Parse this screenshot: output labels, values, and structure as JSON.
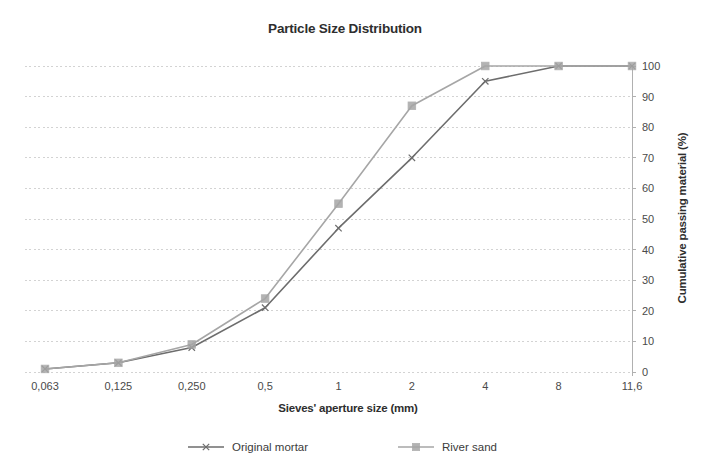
{
  "chart_data": {
    "type": "line",
    "title": "Particle Size Distribution",
    "xlabel": "Sieves' aperture size (mm)",
    "ylabel": "Cumulative passing material (%)",
    "categories": [
      "0,063",
      "0,125",
      "0,250",
      "0,5",
      "1",
      "2",
      "4",
      "8",
      "11,6"
    ],
    "ylim": [
      0,
      100
    ],
    "yticks": [
      "0",
      "10",
      "20",
      "30",
      "40",
      "50",
      "60",
      "70",
      "80",
      "90",
      "100"
    ],
    "grid": true,
    "y_axis_position": "right",
    "legend_position": "bottom",
    "series": [
      {
        "name": "Original mortar",
        "values": [
          1,
          3,
          8,
          21,
          47,
          70,
          95,
          100,
          100
        ],
        "color": "#6d6d6d",
        "marker": "x"
      },
      {
        "name": "River sand",
        "values": [
          1,
          3,
          9,
          24,
          55,
          87,
          100,
          100,
          100
        ],
        "color": "#a6a6a6",
        "marker": "square"
      }
    ]
  },
  "legend": {
    "items": [
      {
        "label": "Original mortar"
      },
      {
        "label": "River sand"
      }
    ]
  },
  "colors": {
    "grid": "#d3d3d3",
    "axis": "#b0b0b0",
    "text": "#3b3b3b",
    "series_mortar": "#6d6d6d",
    "series_sand": "#a6a6a6"
  }
}
